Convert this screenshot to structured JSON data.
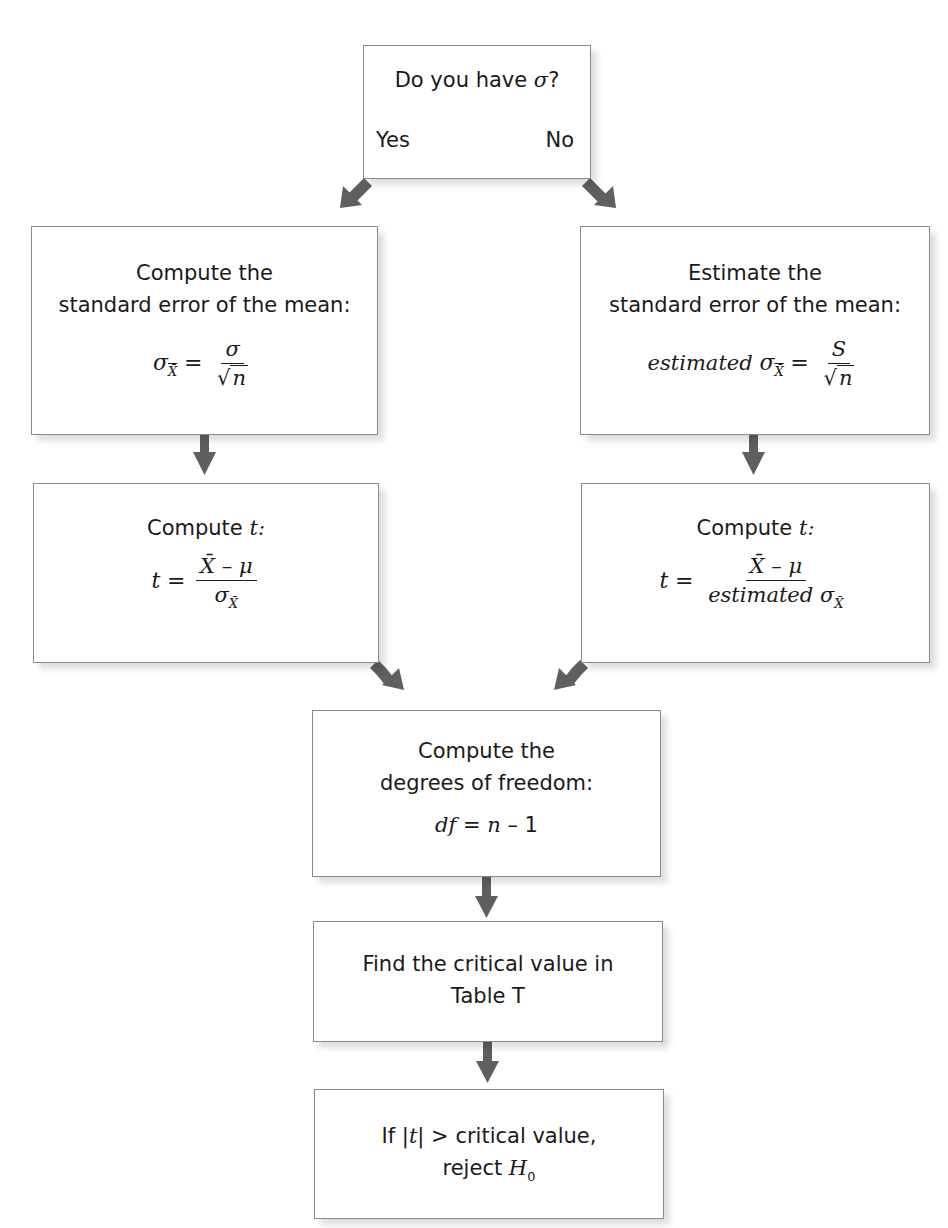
{
  "decision_box": {
    "question_prefix": "Do you have ",
    "question_symbol": "σ",
    "question_suffix": "?",
    "yes_label": "Yes",
    "no_label": "No"
  },
  "left_branch": {
    "se_box": {
      "line1": "Compute the",
      "line2": "standard error of the mean:",
      "lhs": "σ",
      "lhs_sub": "X̄",
      "equals": "=",
      "numerator": "σ",
      "denominator_radicand": "n"
    },
    "t_box": {
      "line1": "Compute ",
      "line1_var": "t",
      "line1_suffix": ":",
      "lhs": "t",
      "equals": "=",
      "numerator": "X̄ – μ",
      "denominator": "σ",
      "denominator_sub": "X̄"
    }
  },
  "right_branch": {
    "se_box": {
      "line1": "Estimate the",
      "line2": "standard error of the mean:",
      "lhs_prefix": "estimated ",
      "lhs": "σ",
      "lhs_sub": "X̄",
      "equals": "=",
      "numerator": "S",
      "denominator_radicand": "n"
    },
    "t_box": {
      "line1": "Compute ",
      "line1_var": "t",
      "line1_suffix": ":",
      "lhs": "t",
      "equals": "=",
      "numerator": "X̄ – μ",
      "denominator_prefix": "estimated ",
      "denominator": "σ",
      "denominator_sub": "X̄"
    }
  },
  "df_box": {
    "line1": "Compute the",
    "line2": "degrees of freedom:",
    "formula_var": "df",
    "formula_rest": " = ",
    "formula_n": "n",
    "formula_tail": " – 1"
  },
  "critical_box": {
    "line1": "Find the critical value in",
    "line2": "Table T"
  },
  "decision_rule_box": {
    "line1_prefix": "If |",
    "line1_var": "t",
    "line1_suffix": "| > critical value,",
    "line2_prefix": "reject ",
    "line2_var": "H",
    "line2_sub": "0"
  },
  "colors": {
    "arrow": "#5f5f5f",
    "box_border": "#8a8a8a",
    "text": "#1a1a1a"
  }
}
